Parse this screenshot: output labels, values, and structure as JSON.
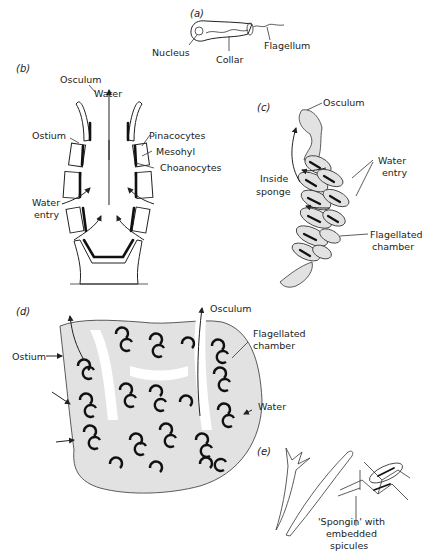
{
  "figure": {
    "panels": {
      "a": {
        "tag": "(a)",
        "labels": {
          "nucleus": "Nucleus",
          "collar": "Collar",
          "flagellum": "Flagellum"
        }
      },
      "b": {
        "tag": "(b)",
        "labels": {
          "osculum": "Osculum",
          "water": "Water",
          "ostium": "Ostium",
          "pinacocytes": "Pinacocytes",
          "mesohyl": "Mesohyl",
          "choanocytes": "Choanocytes",
          "water_entry_1": "Water",
          "water_entry_2": "entry"
        }
      },
      "c": {
        "tag": "(c)",
        "labels": {
          "osculum": "Osculum",
          "water_entry_1": "Water",
          "water_entry_2": "entry",
          "inside_1": "Inside",
          "inside_2": "sponge",
          "flag_1": "Flagellated",
          "flag_2": "chamber"
        }
      },
      "d": {
        "tag": "(d)",
        "labels": {
          "osculum": "Osculum",
          "flag_1": "Flagellated",
          "flag_2": "chamber",
          "ostium": "Ostium",
          "water": "Water"
        }
      },
      "e": {
        "tag": "(e)",
        "labels": {
          "spongin_1": "'Spongin' with",
          "spongin_2": "embedded",
          "spongin_3": "spicules"
        }
      }
    },
    "colors": {
      "line": "#222222",
      "stipple": "#e2e2e2",
      "background": "#ffffff"
    }
  }
}
